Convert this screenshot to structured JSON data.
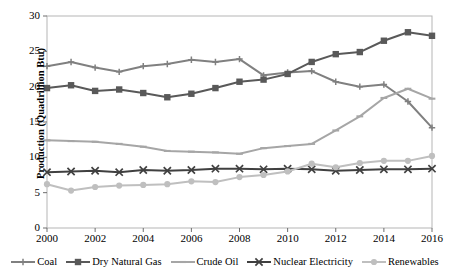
{
  "chart_data": {
    "type": "line",
    "title": "",
    "xlabel": "",
    "ylabel": "Production (Quadrillion Btu)",
    "x": [
      2000,
      2001,
      2002,
      2003,
      2004,
      2005,
      2006,
      2007,
      2008,
      2009,
      2010,
      2011,
      2012,
      2013,
      2014,
      2015,
      2016
    ],
    "xtick_labels": [
      "2000",
      "2002",
      "2004",
      "2006",
      "2008",
      "2010",
      "2012",
      "2014",
      "2016"
    ],
    "xticks": [
      2000,
      2002,
      2004,
      2006,
      2008,
      2010,
      2012,
      2014,
      2016
    ],
    "xlim": [
      2000,
      2016
    ],
    "ytick_labels": [
      "0",
      "5",
      "10",
      "15",
      "20",
      "25",
      "30"
    ],
    "yticks": [
      0,
      5,
      10,
      15,
      20,
      25,
      30
    ],
    "ylim": [
      0,
      30
    ],
    "grid": false,
    "legend_position": "bottom",
    "series": [
      {
        "name": "Coal",
        "color": "#808080",
        "marker": "plus",
        "values": [
          22.9,
          23.5,
          22.7,
          22.1,
          22.9,
          23.2,
          23.8,
          23.5,
          23.9,
          21.6,
          22.0,
          22.2,
          20.7,
          20.0,
          20.3,
          17.9,
          14.2
        ]
      },
      {
        "name": "Dry Natural Gas",
        "color": "#595959",
        "marker": "square",
        "values": [
          19.8,
          20.2,
          19.4,
          19.6,
          19.1,
          18.5,
          19.0,
          19.8,
          20.7,
          21.0,
          21.8,
          23.5,
          24.6,
          24.9,
          26.5,
          27.7,
          27.2
        ]
      },
      {
        "name": "Crude Oil",
        "color": "#a6a6a6",
        "marker": "dash",
        "values": [
          12.4,
          12.3,
          12.2,
          11.9,
          11.5,
          10.9,
          10.8,
          10.7,
          10.5,
          11.3,
          11.6,
          11.9,
          13.8,
          15.8,
          18.4,
          19.7,
          18.3
        ]
      },
      {
        "name": "Nuclear Electricity",
        "color": "#404040",
        "marker": "x",
        "values": [
          7.9,
          8.0,
          8.1,
          7.9,
          8.2,
          8.1,
          8.2,
          8.4,
          8.4,
          8.3,
          8.4,
          8.3,
          8.1,
          8.2,
          8.3,
          8.3,
          8.4
        ]
      },
      {
        "name": "Renewables",
        "color": "#bfbfbf",
        "marker": "circle",
        "values": [
          6.2,
          5.3,
          5.8,
          6.0,
          6.1,
          6.2,
          6.6,
          6.5,
          7.2,
          7.5,
          8.0,
          9.1,
          8.6,
          9.2,
          9.5,
          9.5,
          10.2
        ]
      }
    ]
  },
  "axes": {
    "y_title": "Production (Quadrillion Btu)"
  },
  "legend": {
    "items": [
      {
        "label": "Coal"
      },
      {
        "label": "Dry Natural Gas"
      },
      {
        "label": "Crude Oil"
      },
      {
        "label": "Nuclear Electricity"
      },
      {
        "label": "Renewables"
      }
    ]
  }
}
